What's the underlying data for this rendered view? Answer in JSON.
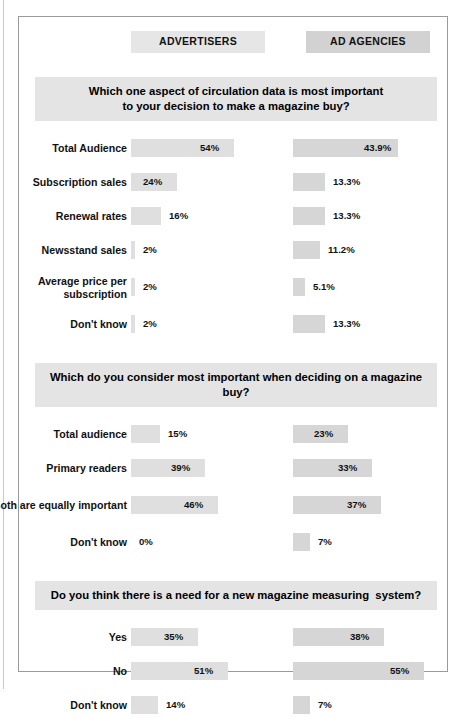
{
  "headers": {
    "advertisers": "ADVERTISERS",
    "ad_agencies": "AD AGENCIES"
  },
  "chart_data": {
    "type": "bar",
    "title": "",
    "orientation": "horizontal",
    "legend_position": "top",
    "grid": false,
    "xlabel": "",
    "ylabel": "",
    "units": "%",
    "series": [
      {
        "name": "ADVERTISERS"
      },
      {
        "name": "AD AGENCIES"
      }
    ],
    "sections": [
      {
        "question": "Which one aspect of circulation data is most important\nto your decision to make a magazine buy?",
        "categories": [
          "Total Audience",
          "Subscription sales",
          "Renewal rates",
          "Newsstand sales",
          "Average price\nper subscription",
          "Don't know"
        ],
        "rows": [
          {
            "label": "Total Audience",
            "advertisers": 54,
            "ad_agencies": 43.9,
            "advertisers_label": "54%",
            "ad_agencies_label": "43.9%"
          },
          {
            "label": "Subscription sales",
            "advertisers": 24,
            "ad_agencies": 13.3,
            "advertisers_label": "24%",
            "ad_agencies_label": "13.3%"
          },
          {
            "label": "Renewal rates",
            "advertisers": 16,
            "ad_agencies": 13.3,
            "advertisers_label": "16%",
            "ad_agencies_label": "13.3%"
          },
          {
            "label": "Newsstand sales",
            "advertisers": 2,
            "ad_agencies": 11.2,
            "advertisers_label": "2%",
            "ad_agencies_label": "11.2%"
          },
          {
            "label": "Average price\nper subscription",
            "advertisers": 2,
            "ad_agencies": 5.1,
            "advertisers_label": "2%",
            "ad_agencies_label": "5.1%"
          },
          {
            "label": "Don't know",
            "advertisers": 2,
            "ad_agencies": 13.3,
            "advertisers_label": "2%",
            "ad_agencies_label": "13.3%"
          }
        ]
      },
      {
        "question": "Which do you consider most important when deciding on a magazine buy?",
        "categories": [
          "Total audience",
          "Primary readers",
          "Both are equally\nimportant",
          "Don't know"
        ],
        "rows": [
          {
            "label": "Total audience",
            "advertisers": 15,
            "ad_agencies": 23,
            "advertisers_label": "15%",
            "ad_agencies_label": "23%"
          },
          {
            "label": "Primary readers",
            "advertisers": 39,
            "ad_agencies": 33,
            "advertisers_label": "39%",
            "ad_agencies_label": "33%"
          },
          {
            "label": "Both are equally\nimportant",
            "advertisers": 46,
            "ad_agencies": 37,
            "advertisers_label": "46%",
            "ad_agencies_label": "37%"
          },
          {
            "label": "Don't know",
            "advertisers": 0,
            "ad_agencies": 7,
            "advertisers_label": "0%",
            "ad_agencies_label": "7%"
          }
        ]
      },
      {
        "question": "Do you think there is a need for a new magazine measuring  system?",
        "categories": [
          "Yes",
          "No",
          "Don't know"
        ],
        "rows": [
          {
            "label": "Yes",
            "advertisers": 35,
            "ad_agencies": 38,
            "advertisers_label": "35%",
            "ad_agencies_label": "38%"
          },
          {
            "label": "No",
            "advertisers": 51,
            "ad_agencies": 55,
            "advertisers_label": "51%",
            "ad_agencies_label": "55%"
          },
          {
            "label": "Don't know",
            "advertisers": 14,
            "ad_agencies": 7,
            "advertisers_label": "14%",
            "ad_agencies_label": "7%"
          }
        ]
      }
    ],
    "colors": {
      "bar_advertisers": "#dfdfdf",
      "bar_ad_agencies": "#d6d6d6",
      "banner": "#e4e4e4",
      "header_advertisers": "#e6e6e6",
      "header_ad_agencies": "#d2d2d2",
      "text": "#111111",
      "frame": "#9a9a9a"
    }
  }
}
